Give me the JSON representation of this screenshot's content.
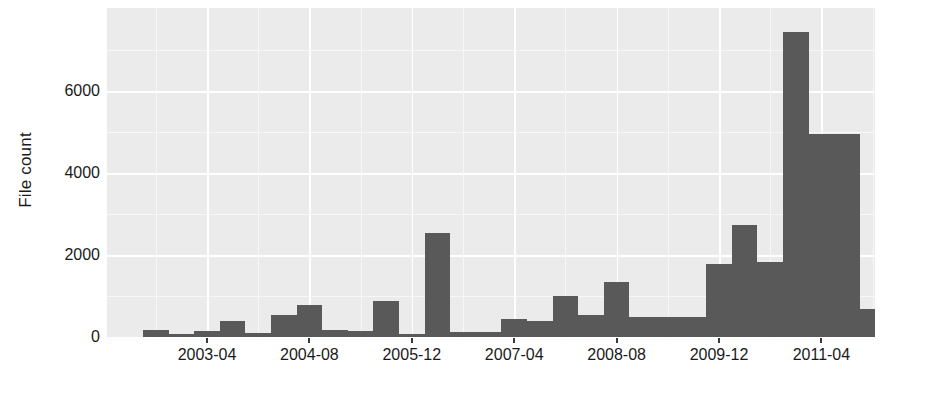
{
  "chart_data": {
    "type": "bar",
    "title": "",
    "subtitle": "",
    "xlabel": "",
    "ylabel": "File count",
    "grid": true,
    "legend": false,
    "legend_position": "none",
    "bar_color": "#595959",
    "panel_color": "#ebebeb",
    "gridline_color": "#ffffff",
    "ylim": [
      0,
      7700
    ],
    "yticks": [
      0,
      2000,
      4000,
      6000
    ],
    "ytick_labels": [
      "0",
      "2000",
      "4000",
      "6000"
    ],
    "xtick_labels": [
      "2003-04",
      "2004-08",
      "2005-12",
      "2007-04",
      "2008-08",
      "2009-12",
      "2011-04"
    ],
    "xtick_index": [
      2,
      6,
      10,
      14,
      18,
      22,
      26
    ],
    "categories": [
      "2002-08",
      "2002-12",
      "2003-04",
      "2003-08",
      "2003-12",
      "2004-04",
      "2004-08",
      "2004-12",
      "2005-04",
      "2005-08",
      "2005-12",
      "2006-04",
      "2006-08",
      "2006-12",
      "2007-04",
      "2007-08",
      "2007-12",
      "2008-04",
      "2008-08",
      "2008-12",
      "2009-04",
      "2009-08",
      "2009-12",
      "2010-04",
      "2010-08",
      "2010-12",
      "2011-04",
      "2011-08"
    ],
    "values": [
      170,
      70,
      150,
      390,
      100,
      540,
      780,
      170,
      140,
      870,
      70,
      2530,
      130,
      120,
      430,
      400,
      990,
      540,
      1340,
      490,
      480,
      480,
      1780,
      2740,
      1840,
      7440,
      4940,
      4960
    ],
    "bar_count": 30,
    "bars": [
      {
        "index": 0,
        "value": 170
      },
      {
        "index": 1,
        "value": 70
      },
      {
        "index": 2,
        "value": 150
      },
      {
        "index": 3,
        "value": 390
      },
      {
        "index": 4,
        "value": 100
      },
      {
        "index": 5,
        "value": 540
      },
      {
        "index": 6,
        "value": 780
      },
      {
        "index": 7,
        "value": 170
      },
      {
        "index": 8,
        "value": 140
      },
      {
        "index": 9,
        "value": 870
      },
      {
        "index": 10,
        "value": 70
      },
      {
        "index": 11,
        "value": 2530
      },
      {
        "index": 12,
        "value": 130
      },
      {
        "index": 13,
        "value": 120
      },
      {
        "index": 14,
        "value": 430
      },
      {
        "index": 15,
        "value": 400
      },
      {
        "index": 16,
        "value": 990
      },
      {
        "index": 17,
        "value": 540
      },
      {
        "index": 18,
        "value": 1340
      },
      {
        "index": 19,
        "value": 490
      },
      {
        "index": 20,
        "value": 480
      },
      {
        "index": 21,
        "value": 480
      },
      {
        "index": 22,
        "value": 1780
      },
      {
        "index": 23,
        "value": 2740
      },
      {
        "index": 24,
        "value": 1840
      },
      {
        "index": 25,
        "value": 7440
      },
      {
        "index": 26,
        "value": 4940
      },
      {
        "index": 27,
        "value": 4960
      },
      {
        "index": 28,
        "value": 690
      },
      {
        "index": 29,
        "value": 420
      },
      {
        "index": 30,
        "value": 2900
      },
      {
        "index": 31,
        "value": 3430
      }
    ]
  }
}
